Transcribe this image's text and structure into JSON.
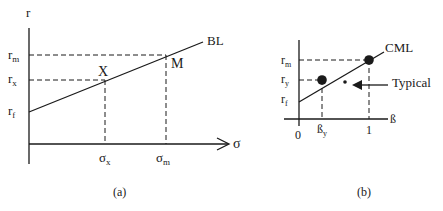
{
  "panel_a": {
    "caption": "(a)",
    "y_axis_label": "r",
    "x_axis_label": "σ",
    "line_label": "BL",
    "y_ticks": {
      "rm": {
        "base": "r",
        "sub": "m"
      },
      "rx": {
        "base": "r",
        "sub": "x"
      },
      "rf": {
        "base": "r",
        "sub": "f"
      }
    },
    "x_ticks": {
      "sx": {
        "base": "σ",
        "sub": "x"
      },
      "sm": {
        "base": "σ",
        "sub": "m"
      }
    },
    "points": {
      "x": "X",
      "m": "M"
    }
  },
  "panel_b": {
    "caption": "(b)",
    "x_axis_label": "ß",
    "line_label": "CML",
    "annotation": "Typical",
    "y_ticks": {
      "rm": {
        "base": "r",
        "sub": "m"
      },
      "ry": {
        "base": "r",
        "sub": "y"
      },
      "rf": {
        "base": "r",
        "sub": "f"
      }
    },
    "x_ticks": {
      "origin": "0",
      "by": {
        "base": "ß",
        "sub": "y"
      },
      "one": "1"
    }
  }
}
